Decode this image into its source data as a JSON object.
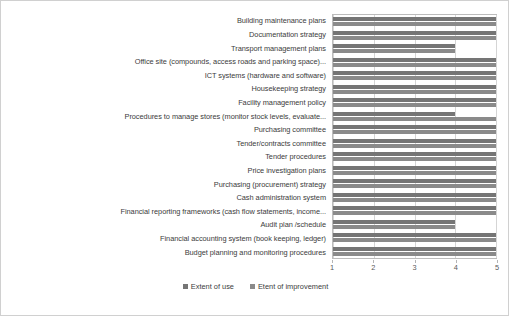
{
  "chart_data": {
    "type": "bar",
    "orientation": "horizontal",
    "title": "",
    "xlabel": "",
    "ylabel": "",
    "xlim": [
      1,
      5
    ],
    "xticks": [
      "1",
      "2",
      "3",
      "4",
      "5"
    ],
    "grid": true,
    "legend_position": "bottom",
    "categories": [
      "Building maintenance plans",
      "Documentation strategy",
      "Transport management plans",
      "Office site (compounds, access roads and parking space)...",
      "ICT systems (hardware and software)",
      "Housekeeping strategy",
      "Facility management policy",
      "Procedures to manage stores (monitor stock levels, evaluate...",
      "Purchasing committee",
      "Tender/contracts committee",
      "Tender procedures",
      "Price investigation plans",
      "Purchasing (procurement) strategy",
      "Cash administration system",
      "Financial reporting frameworks (cash flow statements, income...",
      "Audit plan /schedule",
      "Financial accounting system (book keeping, ledger)",
      "Budget planning and monitoring procedures"
    ],
    "series": [
      {
        "name": "Extent of use",
        "color": "#757575",
        "values": [
          5,
          5,
          4,
          5,
          5,
          5,
          5,
          4,
          5,
          5,
          5,
          5,
          5,
          5,
          5,
          4,
          5,
          5
        ]
      },
      {
        "name": "Etent of improvement",
        "color": "#8a8a8a",
        "values": [
          5,
          5,
          4,
          5,
          5,
          5,
          5,
          5,
          5,
          5,
          5,
          5,
          5,
          5,
          5,
          4,
          5,
          5
        ]
      }
    ]
  },
  "legend": {
    "items": [
      {
        "label": "Extent of use"
      },
      {
        "label": "Etent of improvement"
      }
    ]
  }
}
